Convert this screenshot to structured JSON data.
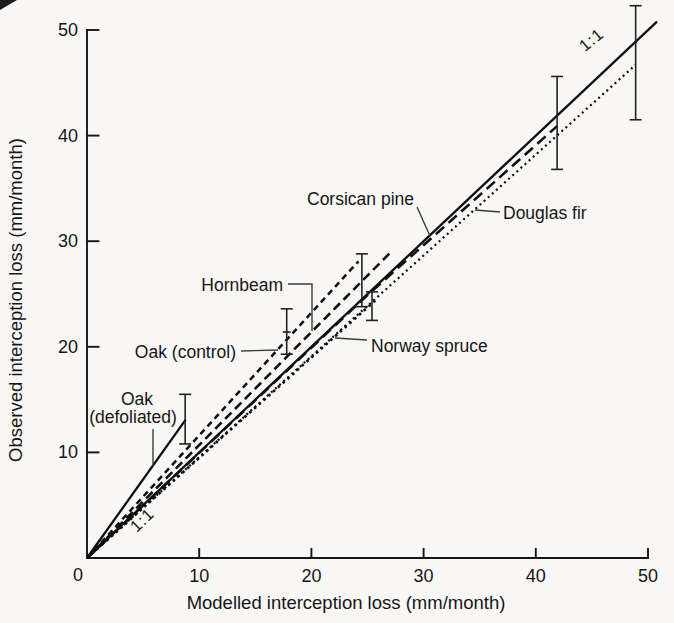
{
  "figure": {
    "background": "#f8f7f5",
    "ink": "#101010"
  },
  "chart_data": {
    "type": "line",
    "title": "",
    "xlabel": "Modelled interception loss (mm/month)",
    "ylabel": "Observed interception loss (mm/month)",
    "xlim": [
      0,
      50
    ],
    "ylim": [
      0,
      50
    ],
    "grid": false,
    "legend_position": "inline-labels",
    "origin_label": "0",
    "xticks": [
      10,
      20,
      30,
      40,
      50
    ],
    "yticks": [
      10,
      20,
      30,
      40,
      50
    ],
    "series": [
      {
        "name": "1:1 line",
        "style": "solid",
        "points": [
          [
            0,
            0
          ],
          [
            50.8,
            50.8
          ]
        ],
        "slope": 1.0
      },
      {
        "name": "Oak (defoliated)",
        "style": "solid",
        "points": [
          [
            0,
            0
          ],
          [
            8.8,
            13.1
          ]
        ],
        "slope": 1.49,
        "error_bar": {
          "x": 8.75,
          "y": 13.1,
          "lo": 10.8,
          "hi": 15.5
        }
      },
      {
        "name": "Oak (control)",
        "style": "short-dash",
        "points": [
          [
            0,
            0
          ],
          [
            24.2,
            28.1
          ]
        ],
        "slope": 1.16,
        "error_bar": {
          "x": 17.8,
          "y": 21.4,
          "lo": 19.3,
          "hi": 23.6,
          "mid_tick": true
        }
      },
      {
        "name": "Hornbeam",
        "style": "medium-dash",
        "points": [
          [
            0,
            0
          ],
          [
            27.2,
            29.1
          ]
        ],
        "slope": 1.07,
        "error_bar": {
          "x": 24.5,
          "y": 26.3,
          "lo": 23.8,
          "hi": 28.8
        }
      },
      {
        "name": "Corsican pine",
        "style": "long-dash",
        "points": [
          [
            0,
            0
          ],
          [
            25,
            24.9
          ],
          [
            41.9,
            40.9
          ]
        ],
        "slope": 0.98,
        "error_bar": {
          "x": 41.9,
          "y": 41.2,
          "lo": 36.8,
          "hi": 45.6
        }
      },
      {
        "name": "Norway spruce",
        "style": "dotted-bold",
        "points": [
          [
            0,
            0
          ],
          [
            25.8,
            24.5
          ]
        ],
        "slope": 0.95,
        "error_bar": {
          "x": 25.4,
          "y": 23.8,
          "lo": 22.5,
          "hi": 25.2
        }
      },
      {
        "name": "Douglas fir",
        "style": "dotted-fine",
        "points": [
          [
            0,
            0
          ],
          [
            48.9,
            46.7
          ]
        ],
        "slope": 0.955,
        "error_bar": {
          "x": 48.9,
          "y": 46.9,
          "lo": 41.5,
          "hi": 52.3
        }
      }
    ],
    "labels": [
      {
        "text": "Corsican pine",
        "x": 414,
        "y": 205,
        "anchor": "end",
        "leader": [
          [
            417,
            207
          ],
          [
            430,
            236
          ]
        ]
      },
      {
        "text": "Douglas fir",
        "x": 503,
        "y": 219,
        "anchor": "start",
        "leader": [
          [
            500,
            212
          ],
          [
            475,
            210
          ]
        ]
      },
      {
        "text": "Hornbeam",
        "x": 283,
        "y": 291,
        "anchor": "end",
        "leader": [
          [
            288,
            284
          ],
          [
            312,
            284
          ],
          [
            312,
            331
          ]
        ]
      },
      {
        "text": "Oak (control)",
        "x": 236,
        "y": 358,
        "anchor": "end",
        "leader": [
          [
            241,
            351
          ],
          [
            278,
            350
          ]
        ]
      },
      {
        "text": "Norway spruce",
        "x": 371,
        "y": 352,
        "anchor": "start",
        "leader": [
          [
            367,
            340
          ],
          [
            335,
            338
          ]
        ]
      },
      {
        "text": "Oak",
        "x": 137,
        "y": 405,
        "anchor": "middle"
      },
      {
        "text": "(defoliated)",
        "x": 133,
        "y": 423,
        "anchor": "middle",
        "leader": [
          [
            153,
            429
          ],
          [
            153,
            466
          ]
        ]
      },
      {
        "text": "1:1",
        "x": 146,
        "y": 524,
        "anchor": "middle",
        "rotate": -44,
        "cls": "ratio"
      },
      {
        "text": "1:1",
        "x": 595,
        "y": 44,
        "anchor": "middle",
        "rotate": -40,
        "cls": "ratio"
      }
    ]
  }
}
